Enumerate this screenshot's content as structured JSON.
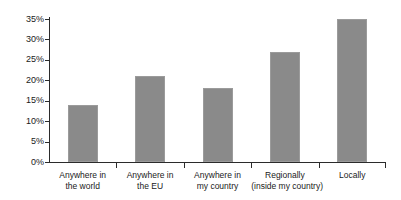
{
  "chart_data": {
    "type": "bar",
    "title": "",
    "subtitle": "",
    "xlabel": "",
    "ylabel": "",
    "categories": [
      "Anywhere in the world",
      "Anywhere in the EU",
      "Anywhere in my country",
      "Regionally (inside my country)",
      "Locally"
    ],
    "category_lines": [
      [
        "Anywhere in",
        "the world"
      ],
      [
        "Anywhere in",
        "the EU"
      ],
      [
        "Anywhere in",
        "my country"
      ],
      [
        "Regionally",
        "(inside my country)"
      ],
      [
        "Locally",
        ""
      ]
    ],
    "values": [
      14,
      21,
      18,
      27,
      35
    ],
    "value_labels": [
      "14%",
      "21%",
      "18%",
      "27%",
      "35%"
    ],
    "ylim": [
      0,
      35
    ],
    "ytick_values": [
      0,
      5,
      10,
      15,
      20,
      25,
      30,
      35
    ],
    "ytick_labels": [
      "0%",
      "5%",
      "10%",
      "15%",
      "20%",
      "25%",
      "30%",
      "35%"
    ],
    "grid": false,
    "legend": null,
    "legend_position": "none",
    "bar_color": "#8a8a8a",
    "axis_color": "#2b2b2b",
    "background_color": "#ffffff"
  }
}
